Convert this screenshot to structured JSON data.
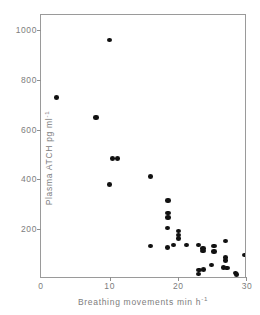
{
  "chart_data": {
    "type": "scatter",
    "title": "",
    "xlabel": "Breathing movements min h",
    "xlabel_exponent": "-1",
    "ylabel": "Plasma ATCH pg ml",
    "ylabel_exponent": "-1",
    "xlim": [
      0,
      30
    ],
    "ylim": [
      0,
      1060
    ],
    "xticks": [
      0,
      10,
      20,
      30
    ],
    "xtick_labels": [
      "0",
      "10",
      "20",
      "30"
    ],
    "yticks": [
      200,
      400,
      600,
      800,
      1000
    ],
    "ytick_labels": [
      "200",
      "400",
      "600",
      "800",
      "1000"
    ],
    "grid": false,
    "legend": null,
    "marker": "filled-circle",
    "marker_color": "#111111",
    "frame_color": "#9a9a9a",
    "text_color": "#7d7d7d",
    "points": [
      {
        "x": 2.2,
        "y": 728
      },
      {
        "x": 8.0,
        "y": 648
      },
      {
        "x": 10.0,
        "y": 960
      },
      {
        "x": 10.4,
        "y": 483
      },
      {
        "x": 11.1,
        "y": 483
      },
      {
        "x": 10.0,
        "y": 380
      },
      {
        "x": 16.0,
        "y": 412
      },
      {
        "x": 18.5,
        "y": 316
      },
      {
        "x": 18.5,
        "y": 265
      },
      {
        "x": 18.5,
        "y": 248
      },
      {
        "x": 18.4,
        "y": 204
      },
      {
        "x": 20.0,
        "y": 192
      },
      {
        "x": 20.0,
        "y": 176
      },
      {
        "x": 20.0,
        "y": 162
      },
      {
        "x": 15.9,
        "y": 133
      },
      {
        "x": 18.4,
        "y": 126
      },
      {
        "x": 19.3,
        "y": 137
      },
      {
        "x": 21.2,
        "y": 137
      },
      {
        "x": 22.9,
        "y": 136
      },
      {
        "x": 23.6,
        "y": 122
      },
      {
        "x": 23.6,
        "y": 112
      },
      {
        "x": 25.2,
        "y": 133
      },
      {
        "x": 25.2,
        "y": 110
      },
      {
        "x": 26.9,
        "y": 152
      },
      {
        "x": 26.9,
        "y": 86
      },
      {
        "x": 26.9,
        "y": 74
      },
      {
        "x": 26.6,
        "y": 47
      },
      {
        "x": 27.1,
        "y": 44
      },
      {
        "x": 24.8,
        "y": 56
      },
      {
        "x": 23.7,
        "y": 38
      },
      {
        "x": 22.9,
        "y": 20
      },
      {
        "x": 23.0,
        "y": 36
      },
      {
        "x": 28.3,
        "y": 24
      },
      {
        "x": 28.5,
        "y": 18
      },
      {
        "x": 29.7,
        "y": 96
      }
    ]
  }
}
